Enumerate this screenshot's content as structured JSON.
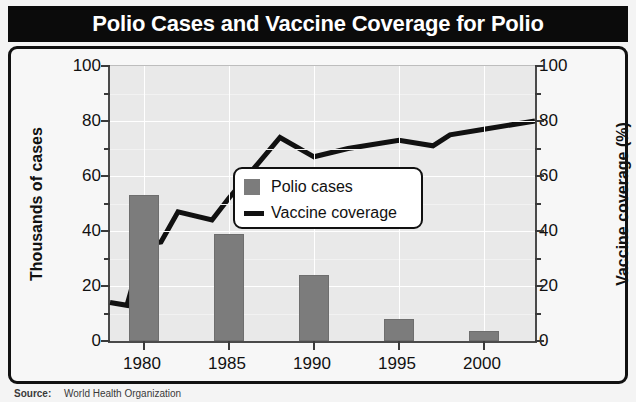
{
  "header": {
    "title": "Polio Cases and Vaccine Coverage for Polio"
  },
  "source": {
    "label": "Source:",
    "text": "World Health Organization"
  },
  "legend": {
    "items": [
      {
        "label": "Polio cases",
        "marker": "square-swatch",
        "color": "#7c7c7c"
      },
      {
        "label": "Vaccine coverage",
        "marker": "line-swatch",
        "color": "#111111"
      }
    ]
  },
  "axes": {
    "left_title": "Thousands of cases",
    "right_title": "Vaccine coverage (%)",
    "left_ticks": [
      "0",
      "20",
      "40",
      "60",
      "80",
      "100"
    ],
    "right_ticks": [
      "0",
      "20",
      "40",
      "60",
      "80",
      "100"
    ],
    "x_ticks": [
      "1980",
      "1985",
      "1990",
      "1995",
      "2000"
    ]
  },
  "colors": {
    "title_bar": "#0b0b0b",
    "title_text": "#ffffff",
    "plot_background": "#e9e9e9",
    "gridline": "#ffffff",
    "bar": "#7c7c7c",
    "line": "#111111",
    "frame": "#111111"
  },
  "chart_data": {
    "type": "bar",
    "title": "Polio Cases and Vaccine Coverage for Polio",
    "xlabel": "",
    "ylabel": "Thousands of cases",
    "y2label": "Vaccine coverage (%)",
    "xlim": [
      1978,
      2003
    ],
    "ylim": [
      0,
      100
    ],
    "y2lim": [
      0,
      100
    ],
    "grid": true,
    "legend_position": "center",
    "series": [
      {
        "name": "Polio cases",
        "type": "bar",
        "axis": "left",
        "unit": "thousands of cases",
        "color": "#7c7c7c",
        "x": [
          1980,
          1985,
          1990,
          1995,
          2000
        ],
        "values": [
          53,
          39,
          24,
          8,
          3.5
        ]
      },
      {
        "name": "Vaccine coverage",
        "type": "line",
        "axis": "right",
        "unit": "percent",
        "color": "#111111",
        "x": [
          1978,
          1979,
          1980,
          1981,
          1982,
          1984,
          1985,
          1988,
          1990,
          1992,
          1995,
          1997,
          1998,
          2000,
          2003
        ],
        "values": [
          14,
          13,
          35,
          36,
          47,
          44,
          52,
          74,
          67,
          70,
          73,
          71,
          75,
          77,
          80
        ]
      }
    ]
  }
}
